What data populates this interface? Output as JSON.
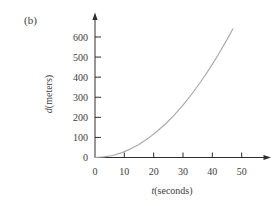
{
  "figure_label": "(b)",
  "colors": {
    "background": "#ffffff",
    "axis": "#2e2e2e",
    "curve": "#a9a9a9",
    "text": "#3d3d3d"
  },
  "chart_data": {
    "type": "line",
    "title": "",
    "xlabel": "t(seconds)",
    "ylabel": "d(meters)",
    "xlabel_var": "t",
    "xlabel_unit": "(seconds)",
    "ylabel_var": "d",
    "ylabel_unit": "(meters)",
    "x_ticks": [
      0,
      10,
      20,
      30,
      40,
      50
    ],
    "y_ticks": [
      0,
      100,
      200,
      300,
      400,
      500,
      600
    ],
    "xlim": [
      0,
      60
    ],
    "ylim": [
      0,
      720
    ],
    "grid": false,
    "legend": "none",
    "series": [
      {
        "name": "distance-vs-time",
        "points": [
          [
            0,
            0
          ],
          [
            3,
            3
          ],
          [
            6,
            10
          ],
          [
            9,
            23
          ],
          [
            12,
            42
          ],
          [
            15,
            65
          ],
          [
            18,
            94
          ],
          [
            21,
            128
          ],
          [
            24,
            167
          ],
          [
            27,
            211
          ],
          [
            30,
            261
          ],
          [
            33,
            316
          ],
          [
            36,
            376
          ],
          [
            39,
            441
          ],
          [
            42,
            512
          ],
          [
            45,
            587
          ],
          [
            47,
            641
          ]
        ]
      }
    ]
  }
}
